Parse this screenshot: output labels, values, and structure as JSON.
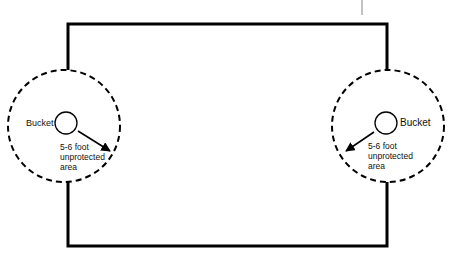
{
  "diagram": {
    "title": "",
    "colors": {
      "line": "#000000",
      "background": "#ffffff",
      "marker": "#999999"
    },
    "perimeter": {
      "x": 68,
      "y": 24,
      "width": 319,
      "height": 222,
      "stroke_width": 3
    },
    "left_zone": {
      "zone_circle": {
        "cx": 64,
        "cy": 126,
        "r": 56
      },
      "bucket": {
        "cx": 66,
        "cy": 123,
        "r": 11
      },
      "bucket_label": "Bucket",
      "area_label_lines": [
        "5-6 foot",
        "unprotected",
        "area"
      ]
    },
    "right_zone": {
      "zone_circle": {
        "cx": 388,
        "cy": 126,
        "r": 56
      },
      "bucket": {
        "cx": 386,
        "cy": 123,
        "r": 11
      },
      "bucket_label": "Bucket",
      "area_label_lines": [
        "5-6 foot",
        "unprotected",
        "area"
      ]
    }
  }
}
